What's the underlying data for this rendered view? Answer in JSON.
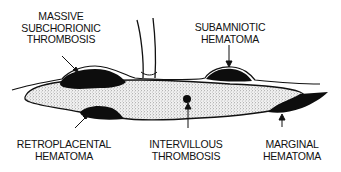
{
  "diagram": {
    "type": "anatomical-cross-section",
    "subject": "placenta",
    "colors": {
      "ink": "#111111",
      "lesion_fill": "#0d0d0d",
      "parenchyma_stipple": "#e6e6e6",
      "background": "#ffffff"
    },
    "labels": [
      {
        "id": "massive-subchorionic-thrombosis",
        "lines": [
          "MASSIVE",
          "SUBCHORIONIC",
          "THROMBOSIS"
        ]
      },
      {
        "id": "subamniotic-hematoma",
        "lines": [
          "SUBAMNIOTIC",
          "HEMATOMA"
        ]
      },
      {
        "id": "retroplacental-hematoma",
        "lines": [
          "RETROPLACENTAL",
          "HEMATOMA"
        ]
      },
      {
        "id": "intervillous-thrombosis",
        "lines": [
          "INTERVILLOUS",
          "THROMBOSIS"
        ]
      },
      {
        "id": "marginal-hematoma",
        "lines": [
          "MARGINAL",
          "HEMATOMA"
        ]
      }
    ]
  }
}
